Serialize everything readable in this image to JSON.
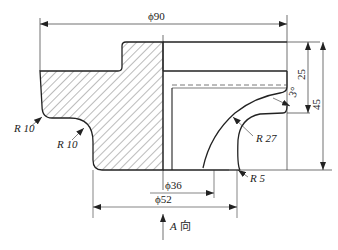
{
  "drawing": {
    "type": "cross-section engineering drawing",
    "dimensions": {
      "overall_diameter": "ϕ90",
      "height_25": "25",
      "height_45": "45",
      "angle": "3°",
      "inner_diameter_36": "ϕ36",
      "diameter_52": "ϕ52"
    },
    "radii": {
      "left_outer": "R 10",
      "left_inner": "R 10",
      "arc": "R 27",
      "bottom": "R 5"
    },
    "view_label": "A 向",
    "view_letter": "A",
    "view_text": "向"
  },
  "colors": {
    "line": "#222222",
    "hatch": "#555555",
    "background": "#ffffff"
  }
}
